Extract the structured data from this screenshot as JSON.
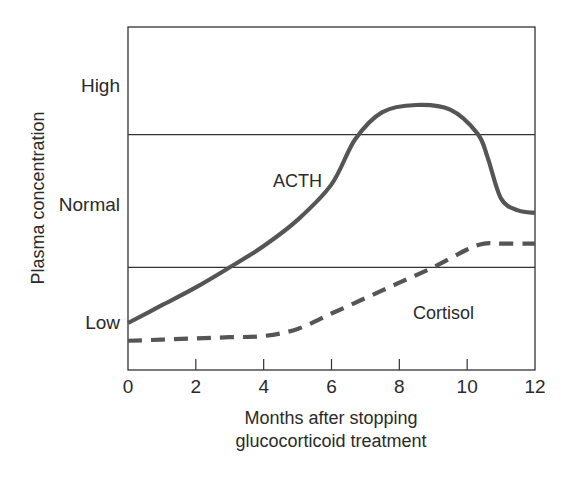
{
  "chart_data": {
    "type": "line",
    "title": "",
    "xlabel": "Months after stopping glucocorticoid treatment",
    "xlabel_lines": [
      "Months after stopping",
      "glucocorticoid treatment"
    ],
    "ylabel": "Plasma concentration",
    "x_ticks": [
      0,
      2,
      4,
      6,
      8,
      10,
      12
    ],
    "xlim": [
      0,
      12
    ],
    "y_ticks": [
      {
        "label": "Low",
        "value": 1
      },
      {
        "label": "Normal",
        "value": 2
      },
      {
        "label": "High",
        "value": 3
      }
    ],
    "ylim": [
      0.6,
      3.5
    ],
    "grid": false,
    "reference_lines": [
      {
        "name": "normal-range-lower",
        "value": 1.47
      },
      {
        "name": "normal-range-upper",
        "value": 2.59
      }
    ],
    "series": [
      {
        "name": "ACTH",
        "style": "solid",
        "x": [
          0,
          1,
          2,
          3,
          4,
          5,
          6,
          6.7,
          7.5,
          8.5,
          9.5,
          10.3,
          10.6,
          11,
          11.5,
          12
        ],
        "values": [
          1.0,
          1.15,
          1.3,
          1.47,
          1.65,
          1.87,
          2.17,
          2.55,
          2.78,
          2.84,
          2.8,
          2.6,
          2.4,
          2.05,
          1.95,
          1.93
        ]
      },
      {
        "name": "Cortisol",
        "style": "dashed",
        "x": [
          0,
          1,
          2,
          3,
          4,
          5,
          6,
          7,
          8,
          9,
          10,
          10.5,
          11,
          12
        ],
        "values": [
          0.85,
          0.86,
          0.87,
          0.88,
          0.89,
          0.95,
          1.08,
          1.21,
          1.34,
          1.47,
          1.62,
          1.67,
          1.67,
          1.67
        ]
      }
    ],
    "annotations": [
      {
        "text": "ACTH",
        "x": 5.0,
        "y": 2.15
      },
      {
        "text": "Cortisol",
        "x": 9.3,
        "y": 1.03
      }
    ],
    "colors": {
      "line": "#555555",
      "frame": "#333333"
    }
  }
}
